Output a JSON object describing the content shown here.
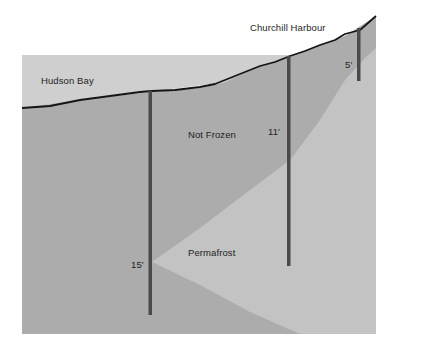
{
  "diagram": {
    "type": "cross-section",
    "labels": {
      "hudson_bay": "Hudson Bay",
      "churchill_harbour": "Churchill Harbour",
      "not_frozen": "Not Frozen",
      "permafrost": "Permafrost"
    },
    "poles": [
      {
        "depth_label": "15′"
      },
      {
        "depth_label": "11′"
      },
      {
        "depth_label": "5′"
      }
    ],
    "colors": {
      "background": "#ffffff",
      "water": "#cfcfcf",
      "not_frozen": "#adadad",
      "permafrost": "#c4c4c4",
      "ground_line": "#151515",
      "pole": "#4a4a4a",
      "text": "#1e1e1e"
    }
  }
}
